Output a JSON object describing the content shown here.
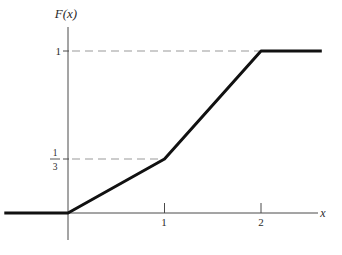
{
  "figure": {
    "background": "#ffffff",
    "curve_color": "#111111",
    "axis_color": "#4a4a4a",
    "tick_color": "#4a4a4a",
    "dash_color": "#9a9a9a",
    "label_color": "#2b2b2b"
  },
  "chart_data": {
    "type": "line",
    "title": "",
    "ylabel": "F(x)",
    "xlabel": "x",
    "x_range": [
      -0.66,
      2.63
    ],
    "y_range": [
      -0.17,
      1.15
    ],
    "grid": false,
    "legend": "none",
    "series": [
      {
        "name": "piecewise-linear CDF F(x)",
        "points": [
          [
            -0.66,
            0
          ],
          [
            0,
            0
          ],
          [
            1,
            0.3333
          ],
          [
            2,
            1
          ],
          [
            2.63,
            1
          ]
        ]
      }
    ],
    "x_ticks": [
      {
        "value": 1,
        "label": "1"
      },
      {
        "value": 2,
        "label": "2"
      }
    ],
    "y_ticks": [
      {
        "value": 1,
        "label": "1"
      },
      {
        "value": 0.3333,
        "label": "1/3",
        "fraction": {
          "numerator": "1",
          "denominator": "3"
        }
      }
    ],
    "guides": [
      {
        "type": "dashed",
        "y": 1,
        "x_from": 0,
        "x_to": 2
      },
      {
        "type": "dashed",
        "y": 0.3333,
        "x_from": 0,
        "x_to": 1
      }
    ]
  }
}
